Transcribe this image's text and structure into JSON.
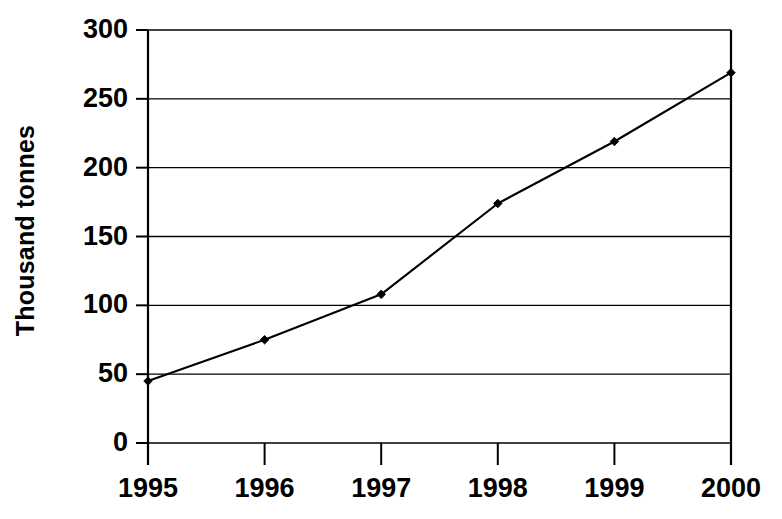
{
  "chart_data": {
    "type": "line",
    "title": "",
    "xlabel": "",
    "ylabel": "Thousand tonnes",
    "categories": [
      "1995",
      "1996",
      "1997",
      "1998",
      "1999",
      "2000"
    ],
    "values": [
      45,
      75,
      108,
      174,
      219,
      269
    ],
    "series": [
      {
        "name": "Thousand tonnes",
        "values": [
          45,
          75,
          108,
          174,
          219,
          269
        ]
      }
    ],
    "ylim": [
      0,
      300
    ],
    "ytick_labels": [
      "0",
      "50",
      "100",
      "150",
      "200",
      "250",
      "300"
    ],
    "ytick_values": [
      0,
      50,
      100,
      150,
      200,
      250,
      300
    ],
    "xtick_labels": [
      "1995",
      "1996",
      "1997",
      "1998",
      "1999",
      "2000"
    ],
    "grid": true,
    "grid_axis": "y",
    "legend": false,
    "legend_position": "none",
    "marker": "diamond",
    "line_color": "#000000",
    "marker_color": "#000000",
    "axis_color": "#000000",
    "grid_color": "#000000",
    "background_color": "#ffffff"
  },
  "axis": {
    "y_title": "Thousand tonnes"
  }
}
